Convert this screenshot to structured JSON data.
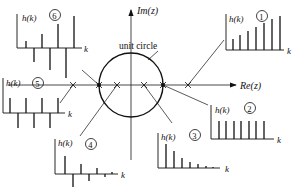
{
  "diagram": {
    "axes": {
      "imag_label": "Im(z)",
      "real_label": "Re(z)",
      "circle_label": "unit circle"
    },
    "colors": {
      "ink": "#111111",
      "axis": "#333333",
      "background": "#ffffff"
    },
    "panels": [
      {
        "id": "1",
        "marker": "1",
        "ylabel": "h(k)",
        "xlabel": "k",
        "description": "positive real pole outside unit circle: growing sequence",
        "pole_x": 188
      },
      {
        "id": "2",
        "marker": "2",
        "ylabel": "h(k)",
        "xlabel": "k",
        "description": "pole at z=1: constant sequence",
        "pole_x": 163
      },
      {
        "id": "3",
        "marker": "3",
        "ylabel": "h(k)",
        "xlabel": "k",
        "description": "positive real pole inside unit circle: decaying sequence",
        "pole_x": 144
      },
      {
        "id": "4",
        "marker": "4",
        "ylabel": "h(k)",
        "xlabel": "k",
        "description": "negative real pole inside unit circle: alternating decaying",
        "pole_x": 117
      },
      {
        "id": "5",
        "marker": "5",
        "ylabel": "h(k)",
        "xlabel": "k",
        "description": "negative real pole outside unit circle: alternating",
        "pole_x": 73
      },
      {
        "id": "6",
        "marker": "6",
        "ylabel": "h(k)",
        "xlabel": "k",
        "description": "pole at z=-1 region: alternating growing",
        "pole_x": 99
      }
    ]
  }
}
